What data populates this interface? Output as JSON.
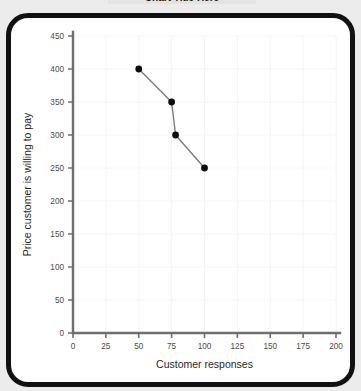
{
  "page": {
    "title_banner_text": "Chart Title Here",
    "background_color": "#ececec",
    "frame_color": "#111111",
    "card_color": "#ffffff"
  },
  "chart_data": {
    "type": "line",
    "title": "",
    "xlabel": "Customer responses",
    "ylabel": "Price customer is willing to pay",
    "xlim": [
      0,
      200
    ],
    "ylim": [
      0,
      450
    ],
    "xticks": [
      0,
      25,
      50,
      75,
      100,
      125,
      150,
      175,
      200
    ],
    "yticks": [
      0,
      50,
      100,
      150,
      200,
      250,
      300,
      350,
      400,
      450
    ],
    "xtick_labels": [
      "0",
      "25",
      "50",
      "75",
      "100",
      "125",
      "150",
      "175",
      "200"
    ],
    "ytick_labels": [
      "0",
      "50",
      "100",
      "150",
      "200",
      "250",
      "300",
      "350",
      "400",
      "450"
    ],
    "grid": true,
    "legend": false,
    "marker_color": "#0d0d0d",
    "line_color": "#7b7b7b",
    "series": [
      {
        "name": "Demand",
        "x": [
          50,
          75,
          78,
          100
        ],
        "y": [
          400,
          350,
          300,
          250
        ]
      }
    ]
  }
}
